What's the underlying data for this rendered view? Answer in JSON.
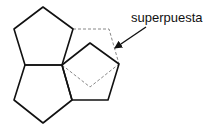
{
  "diagram": {
    "label": "superpuesta",
    "colors": {
      "stroke": "#111111",
      "dashed": "#888888",
      "background": "#ffffff"
    },
    "shapes": [
      {
        "name": "top-pentagon",
        "style": "solid",
        "points": "43,7 73,29 62,65 25,65 14,29"
      },
      {
        "name": "bottom-pentagon",
        "style": "solid",
        "points": "25,65 62,65 72,100 43,123 14,100"
      },
      {
        "name": "right-pentagon",
        "style": "solid",
        "points": "62,65 90,43 119,64 108,100 72,100"
      },
      {
        "name": "overlapped-pentagon",
        "style": "dashed",
        "points": "73,29 109,29 119,64 90,87 62,65"
      }
    ],
    "arrow": {
      "from": [
        146,
        27
      ],
      "to": [
        114,
        49
      ]
    }
  }
}
